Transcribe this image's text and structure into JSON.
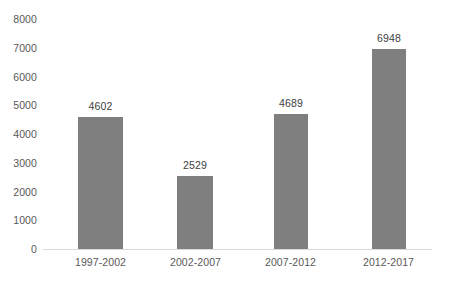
{
  "chart_data": {
    "type": "bar",
    "title": "",
    "subtitle": "",
    "xlabel": "",
    "ylabel": "",
    "categories": [
      "1997-2002",
      "2002-2007",
      "2007-2012",
      "2012-2017"
    ],
    "values": [
      4602,
      2529,
      4689,
      6948
    ],
    "series": [
      {
        "name": "",
        "values": [
          4602,
          2529,
          4689,
          6948
        ]
      }
    ],
    "data_labels": [
      "4602",
      "2529",
      "4689",
      "6948"
    ],
    "ylim": [
      0,
      8000
    ],
    "y_ticks": [
      0,
      1000,
      2000,
      3000,
      4000,
      5000,
      6000,
      7000,
      8000
    ],
    "y_tick_labels": [
      "0",
      "1000",
      "2000",
      "3000",
      "4000",
      "5000",
      "6000",
      "7000",
      "8000"
    ],
    "grid": false,
    "legend": false,
    "legend_position": "none",
    "bar_color": "#7f7f7f",
    "axis_line_color": "#d9d9d9",
    "label_color": "#595959",
    "value_label_color": "#404040",
    "background": "#ffffff"
  }
}
